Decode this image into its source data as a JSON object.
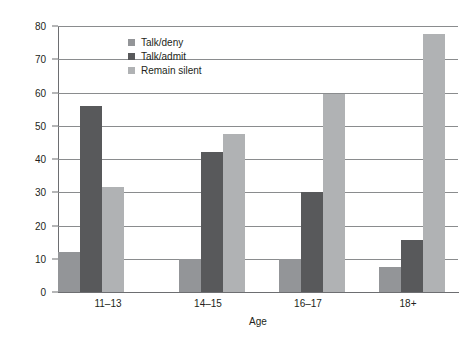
{
  "chart_data": {
    "type": "bar",
    "title": "",
    "xlabel": "Age",
    "ylabel": "Percent",
    "categories": [
      "11–13",
      "14–15",
      "16–17",
      "18+"
    ],
    "series": [
      {
        "name": "Talk/deny",
        "color": "#939598",
        "values": [
          12,
          10,
          10,
          7.5
        ]
      },
      {
        "name": "Talk/admit",
        "color": "#58595b",
        "values": [
          56,
          42,
          30,
          15.5
        ]
      },
      {
        "name": "Remain silent",
        "color": "#b0b2b4",
        "values": [
          31.5,
          47.5,
          59.5,
          77.5
        ]
      }
    ],
    "ylim": [
      0,
      80
    ],
    "yticks": [
      0,
      10,
      20,
      30,
      40,
      50,
      60,
      70,
      80
    ],
    "ytick_labels": [
      "0",
      "10",
      "20",
      "30",
      "40",
      "50",
      "60",
      "70",
      "80"
    ],
    "grid": true,
    "legend_position": "upper-center-left"
  }
}
